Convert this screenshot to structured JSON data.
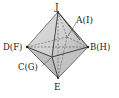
{
  "diagram": {
    "vertices": {
      "top": {
        "label": "J",
        "x": 58,
        "y": 12
      },
      "bottom": {
        "label": "E",
        "x": 58,
        "y": 78
      },
      "left": {
        "label": "D(F)",
        "x": 27,
        "y": 47
      },
      "right": {
        "label": "B(H)",
        "x": 88,
        "y": 47
      },
      "front": {
        "label": "C(G)",
        "x": 52,
        "y": 57
      },
      "back": {
        "label": "A(I)",
        "x": 67,
        "y": 37
      }
    },
    "colors": {
      "fill_light": "#e6e6e6",
      "fill_dark": "#b8b8b8",
      "edge": "#333333"
    }
  }
}
